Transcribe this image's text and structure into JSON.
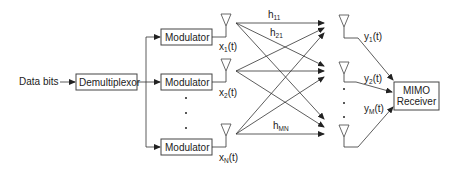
{
  "input": {
    "label": "Data bits"
  },
  "demultiplexor": {
    "label": "Demultiplexor"
  },
  "modulators": [
    {
      "label": "Modulator",
      "signal": "x",
      "sub": "1",
      "suffix": "(t)"
    },
    {
      "label": "Modulator",
      "signal": "x",
      "sub": "2",
      "suffix": "(t)"
    },
    {
      "label": "Modulator",
      "signal": "x",
      "sub": "N",
      "suffix": "(t)"
    }
  ],
  "channel_labels": [
    {
      "base": "h",
      "sub": "11"
    },
    {
      "base": "h",
      "sub": "21"
    },
    {
      "base": "h",
      "sub": "MN"
    }
  ],
  "receive_signals": [
    {
      "base": "y",
      "sub": "1",
      "suffix": "(t)"
    },
    {
      "base": "y",
      "sub": "2",
      "suffix": "(t)"
    },
    {
      "base": "y",
      "sub": "M",
      "suffix": "(t)"
    }
  ],
  "receiver": {
    "line1": "MIMO",
    "line2": "Receiver"
  },
  "ellipsis": "•"
}
